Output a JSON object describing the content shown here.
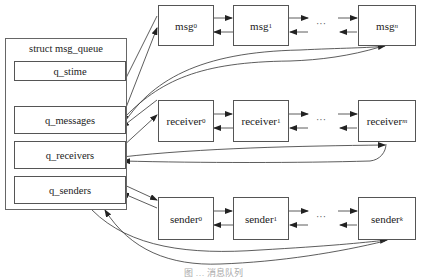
{
  "struct": {
    "title": "struct msg_queue",
    "fields": [
      "q_stime",
      "q_messages",
      "q_receivers",
      "q_senders"
    ],
    "ellipsis": "⋮"
  },
  "rows": {
    "messages": {
      "nodes": [
        {
          "base": "msg",
          "sub": "0"
        },
        {
          "base": "msg",
          "sub": "1"
        },
        {
          "base": "msg",
          "sub": "n"
        }
      ]
    },
    "receivers": {
      "nodes": [
        {
          "base": "receiver",
          "sub": "0"
        },
        {
          "base": "receiver",
          "sub": "1"
        },
        {
          "base": "receiver",
          "sub": "m"
        }
      ]
    },
    "senders": {
      "nodes": [
        {
          "base": "sender",
          "sub": "0"
        },
        {
          "base": "sender",
          "sub": "1"
        },
        {
          "base": "sender",
          "sub": "k"
        }
      ]
    }
  },
  "ellipsis": "···",
  "caption": "图 … 消息队列"
}
